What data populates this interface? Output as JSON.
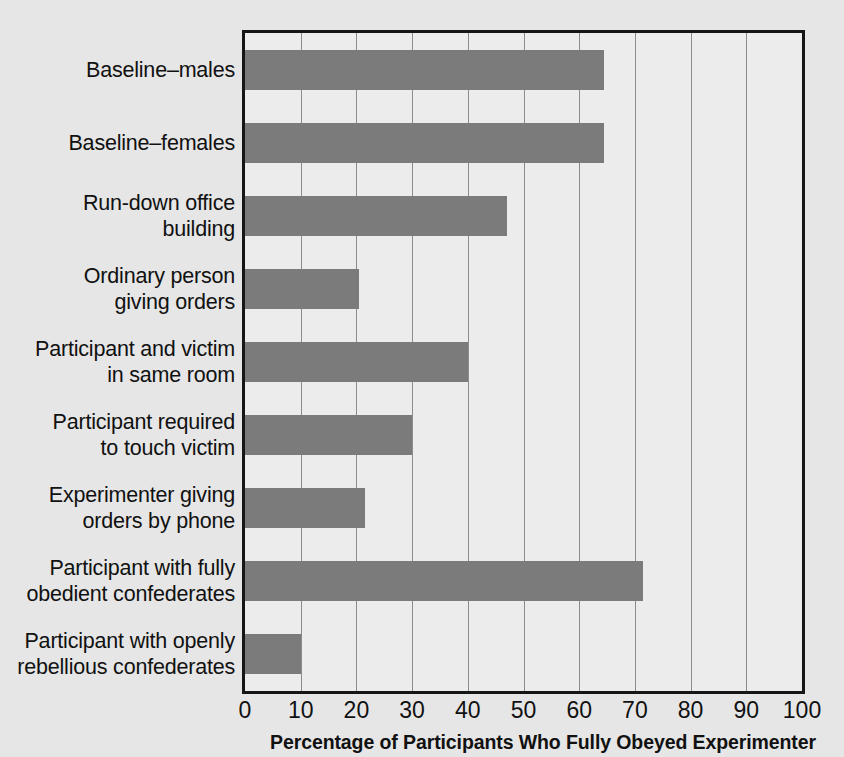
{
  "chart_data": {
    "type": "bar",
    "orientation": "horizontal",
    "title": "",
    "xlabel": "Percentage of Participants Who Fully Obeyed Experimenter",
    "ylabel": "",
    "xlim": [
      0,
      100
    ],
    "xticks": [
      0,
      10,
      20,
      30,
      40,
      50,
      60,
      70,
      80,
      90,
      100
    ],
    "xtick_labels": [
      "0",
      "10",
      "20",
      "30",
      "40",
      "50",
      "60",
      "70",
      "80",
      "90",
      "100"
    ],
    "grid": "vertical",
    "legend": "none",
    "bar_color": "#7b7b7b",
    "plot_background": "#ececec",
    "page_background": "#e6e6e6",
    "axis_color": "#161616",
    "gridline_color": "#8c8c8c",
    "categories": [
      "Baseline–males",
      "Baseline–females",
      "Run-down office building",
      "Ordinary person giving orders",
      "Participant and victim in same room",
      "Participant required to touch victim",
      "Experimenter giving orders by phone",
      "Participant with fully obedient confederates",
      "Participant with openly rebellious confederates"
    ],
    "category_lines": [
      [
        "Baseline–males"
      ],
      [
        "Baseline–females"
      ],
      [
        "Run-down office",
        "building"
      ],
      [
        "Ordinary person",
        "giving orders"
      ],
      [
        "Participant and victim",
        "in same room"
      ],
      [
        "Participant required",
        "to touch victim"
      ],
      [
        "Experimenter giving",
        "orders by phone"
      ],
      [
        "Participant with fully",
        "obedient confederates"
      ],
      [
        "Participant with openly",
        "rebellious confederates"
      ]
    ],
    "values": [
      64.5,
      64.5,
      47,
      20.5,
      40,
      30,
      21.5,
      71.5,
      10
    ]
  }
}
